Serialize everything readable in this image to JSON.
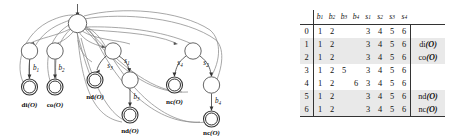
{
  "figure": {
    "kind": "automaton-and-transition-table"
  },
  "automaton": {
    "root": {
      "name": "root-state",
      "incoming_arrow": true
    },
    "branches": [
      {
        "id": "di",
        "mid_state": "mid-state-di",
        "edge_label": "b",
        "edge_sub": "1",
        "accept_label_bold": "di",
        "accept_label_arg": "(O)"
      },
      {
        "id": "co",
        "mid_state": "mid-state-co",
        "edge_label": "b",
        "edge_sub": "2",
        "accept_label_bold": "co",
        "accept_label_arg": "(O)"
      },
      {
        "id": "nd-s3",
        "mid_state": "mid-state-nd",
        "edge_label": "s",
        "edge_sub": "3",
        "accept_label_bold": "nd",
        "accept_label_arg": "(O)"
      },
      {
        "id": "nd-b3",
        "mid_state": "mid-state-nd-b3",
        "edge_label": "b",
        "edge_sub": "3",
        "accept_label_bold": "nd",
        "accept_label_arg": "(O)"
      },
      {
        "id": "nc-s4",
        "mid_state": "mid-state-nc",
        "edge_label": "s",
        "edge_sub": "4",
        "accept_label_bold": "nc",
        "accept_label_arg": "(O)"
      },
      {
        "id": "nc-b4",
        "mid_state": "mid-state-nc-b4",
        "edge_label": "b",
        "edge_sub": "4",
        "accept_label_bold": "nc",
        "accept_label_arg": "(O)"
      }
    ],
    "extra_edge_labels": [
      {
        "label": "s",
        "sub": "1"
      },
      {
        "label": "s",
        "sub": "2"
      }
    ]
  },
  "table": {
    "columns": [
      {
        "base": "b",
        "sub": "1"
      },
      {
        "base": "b",
        "sub": "2"
      },
      {
        "base": "b",
        "sub": "3"
      },
      {
        "base": "b",
        "sub": "4"
      },
      {
        "base": "s",
        "sub": "1"
      },
      {
        "base": "s",
        "sub": "2"
      },
      {
        "base": "s",
        "sub": "3"
      },
      {
        "base": "s",
        "sub": "4"
      }
    ],
    "rows": [
      {
        "id": "0",
        "cells": [
          "1",
          "2",
          "",
          "",
          "3",
          "4",
          "5",
          "6"
        ],
        "end_bold": "",
        "end_arg": "",
        "shaded": false
      },
      {
        "id": "1",
        "cells": [
          "1",
          "2",
          "",
          "",
          "3",
          "4",
          "5",
          "6"
        ],
        "end_bold": "di",
        "end_arg": "(O)",
        "shaded": true
      },
      {
        "id": "2",
        "cells": [
          "1",
          "2",
          "",
          "",
          "3",
          "4",
          "5",
          "6"
        ],
        "end_bold": "co",
        "end_arg": "(O)",
        "shaded": true
      },
      {
        "id": "3",
        "cells": [
          "1",
          "2",
          "5",
          "",
          "3",
          "4",
          "5",
          "6"
        ],
        "end_bold": "",
        "end_arg": "",
        "shaded": false
      },
      {
        "id": "4",
        "cells": [
          "1",
          "2",
          "",
          "6",
          "3",
          "4",
          "5",
          "6"
        ],
        "end_bold": "",
        "end_arg": "",
        "shaded": false
      },
      {
        "id": "5",
        "cells": [
          "1",
          "2",
          "",
          "",
          "3",
          "4",
          "5",
          "6"
        ],
        "end_bold": "nd",
        "end_arg": "(O)",
        "shaded": true
      },
      {
        "id": "6",
        "cells": [
          "1",
          "2",
          "",
          "",
          "3",
          "4",
          "5",
          "6"
        ],
        "end_bold": "nc",
        "end_arg": "(O)",
        "shaded": true
      }
    ]
  }
}
